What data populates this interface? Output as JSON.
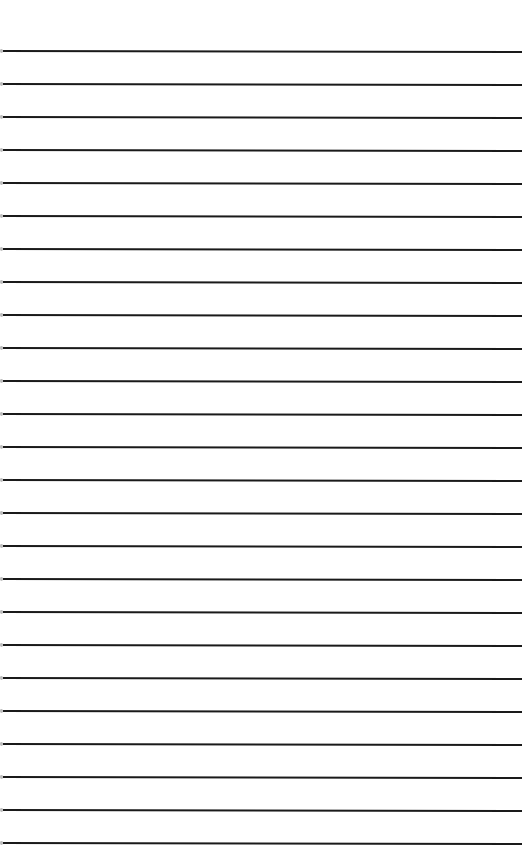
{
  "page": {
    "type": "lined-paper",
    "background_color": "#ffffff",
    "line_color": "#1a1a1a",
    "line_count": 25,
    "first_line_y": 51,
    "line_spacing": 33,
    "text": ""
  }
}
